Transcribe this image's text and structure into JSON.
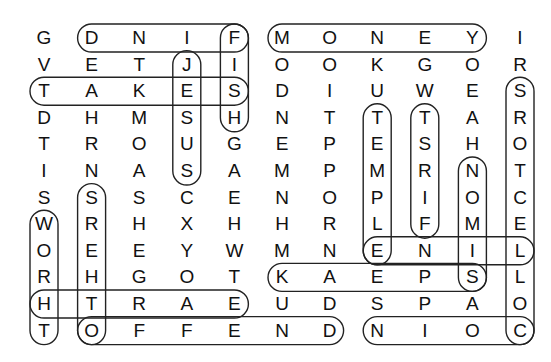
{
  "puzzle": {
    "type": "word-search",
    "cols": 11,
    "rows": 12,
    "grid": [
      [
        "G",
        "D",
        "N",
        "I",
        "F",
        "M",
        "O",
        "N",
        "E",
        "Y",
        "I"
      ],
      [
        "V",
        "E",
        "T",
        "J",
        "I",
        "O",
        "O",
        "K",
        "G",
        "O",
        "R"
      ],
      [
        "T",
        "A",
        "K",
        "E",
        "S",
        "D",
        "I",
        "U",
        "W",
        "E",
        "S"
      ],
      [
        "D",
        "H",
        "M",
        "S",
        "H",
        "N",
        "T",
        "T",
        "T",
        "A",
        "R"
      ],
      [
        "T",
        "R",
        "O",
        "U",
        "G",
        "E",
        "P",
        "E",
        "S",
        "H",
        "O"
      ],
      [
        "I",
        "N",
        "A",
        "S",
        "A",
        "M",
        "P",
        "M",
        "R",
        "N",
        "T"
      ],
      [
        "S",
        "S",
        "S",
        "C",
        "E",
        "N",
        "O",
        "P",
        "I",
        "O",
        "C"
      ],
      [
        "W",
        "R",
        "H",
        "X",
        "H",
        "H",
        "R",
        "L",
        "F",
        "M",
        "E"
      ],
      [
        "O",
        "E",
        "E",
        "Y",
        "W",
        "M",
        "N",
        "E",
        "N",
        "I",
        "L"
      ],
      [
        "R",
        "H",
        "G",
        "O",
        "T",
        "K",
        "A",
        "E",
        "P",
        "S",
        "L"
      ],
      [
        "H",
        "T",
        "R",
        "A",
        "E",
        "U",
        "D",
        "S",
        "P",
        "A",
        "O"
      ],
      [
        "T",
        "O",
        "F",
        "F",
        "E",
        "N",
        "D",
        "N",
        "I",
        "O",
        "C"
      ]
    ],
    "found_words": [
      {
        "word": "FIND",
        "from": [
          0,
          4
        ],
        "to": [
          0,
          1
        ]
      },
      {
        "word": "MONEY",
        "from": [
          0,
          5
        ],
        "to": [
          0,
          9
        ]
      },
      {
        "word": "FISH",
        "from": [
          0,
          4
        ],
        "to": [
          3,
          4
        ]
      },
      {
        "word": "JESUS",
        "from": [
          1,
          3
        ],
        "to": [
          5,
          3
        ]
      },
      {
        "word": "TAKES",
        "from": [
          2,
          0
        ],
        "to": [
          2,
          4
        ]
      },
      {
        "word": "EARTH",
        "from": [
          10,
          4
        ],
        "to": [
          10,
          0
        ]
      },
      {
        "word": "OFFEND",
        "from": [
          11,
          1
        ],
        "to": [
          11,
          6
        ]
      },
      {
        "word": "COIN",
        "from": [
          11,
          10
        ],
        "to": [
          11,
          7
        ]
      },
      {
        "word": "WORTH",
        "from": [
          7,
          0
        ],
        "to": [
          11,
          0
        ]
      },
      {
        "word": "OTHERS",
        "from": [
          11,
          1
        ],
        "to": [
          6,
          1
        ]
      },
      {
        "word": "TEMPLE",
        "from": [
          3,
          7
        ],
        "to": [
          8,
          7
        ]
      },
      {
        "word": "FIRST",
        "from": [
          7,
          8
        ],
        "to": [
          3,
          8
        ]
      },
      {
        "word": "SIMON",
        "from": [
          9,
          9
        ],
        "to": [
          5,
          9
        ]
      },
      {
        "word": "COLLECTORS",
        "from": [
          11,
          10
        ],
        "to": [
          2,
          10
        ]
      },
      {
        "word": "LINE",
        "from": [
          8,
          10
        ],
        "to": [
          8,
          7
        ]
      },
      {
        "word": "SPEAK",
        "from": [
          9,
          9
        ],
        "to": [
          9,
          5
        ]
      }
    ]
  }
}
